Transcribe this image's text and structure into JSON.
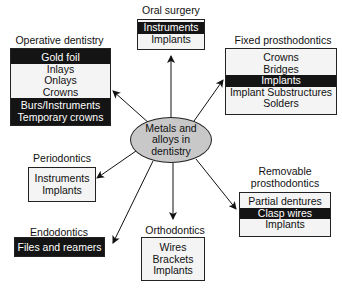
{
  "center": {
    "lines": [
      "Metals and",
      "alloys in",
      "dentistry"
    ]
  },
  "nodes": {
    "oral_surgery": {
      "title": "Oral surgery",
      "items": [
        {
          "label": "Instruments",
          "highlight": true
        },
        {
          "label": "Implants",
          "highlight": false
        }
      ]
    },
    "operative_dentistry": {
      "title": "Operative dentistry",
      "items": [
        {
          "label": "Gold foil",
          "highlight": true
        },
        {
          "label": "Inlays",
          "highlight": false
        },
        {
          "label": "Onlays",
          "highlight": false
        },
        {
          "label": "Crowns",
          "highlight": false
        },
        {
          "label": "Burs/Instruments",
          "highlight": true
        },
        {
          "label": "Temporary crowns",
          "highlight": true
        }
      ]
    },
    "fixed_prosthodontics": {
      "title": "Fixed prosthodontics",
      "items": [
        {
          "label": "Crowns",
          "highlight": false
        },
        {
          "label": "Bridges",
          "highlight": false
        },
        {
          "label": "Implants",
          "highlight": true
        },
        {
          "label": "Implant Substructures",
          "highlight": false
        },
        {
          "label": "Solders",
          "highlight": false
        }
      ]
    },
    "periodontics": {
      "title": "Periodontics",
      "items": [
        {
          "label": "Instruments",
          "highlight": false
        },
        {
          "label": "Implants",
          "highlight": false
        }
      ]
    },
    "removable_prosthodontics": {
      "title_lines": [
        "Removable",
        "prosthodontics"
      ],
      "items": [
        {
          "label": "Partial dentures",
          "highlight": false
        },
        {
          "label": "Clasp wires",
          "highlight": true
        },
        {
          "label": "Implants",
          "highlight": false
        }
      ]
    },
    "endodontics": {
      "title": "Endodontics",
      "items": [
        {
          "label": "Files and reamers",
          "highlight": true
        }
      ]
    },
    "orthodontics": {
      "title": "Orthodontics",
      "items": [
        {
          "label": "Wires",
          "highlight": false
        },
        {
          "label": "Brackets",
          "highlight": false
        },
        {
          "label": "Implants",
          "highlight": false
        }
      ]
    }
  },
  "colors": {
    "highlight_bg": "#141414",
    "highlight_text": "#ffffff",
    "box_bg": "#f4f4f4",
    "center_fill": "#c8c8c8"
  }
}
